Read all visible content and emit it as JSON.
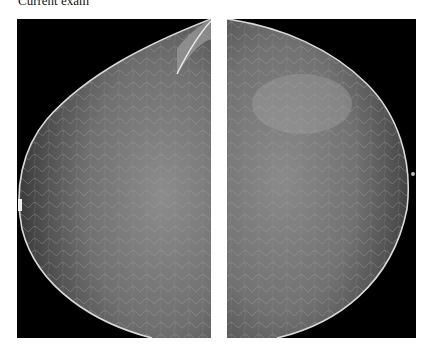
{
  "header": {
    "label": "Current exam"
  },
  "views": [
    {
      "id": "left",
      "description": "mammogram-view-left-breast",
      "background": "#000000",
      "tissue_color": "#7a7a7a"
    },
    {
      "id": "right",
      "description": "mammogram-view-right-breast",
      "background": "#000000",
      "tissue_color": "#7a7a7a"
    }
  ]
}
